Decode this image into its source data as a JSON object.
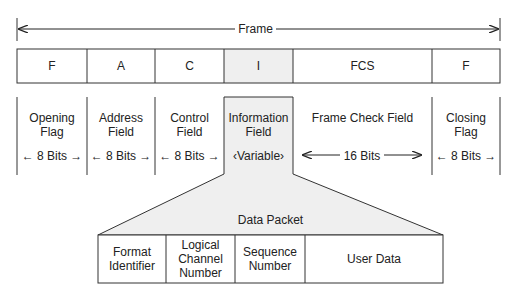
{
  "frame": {
    "title": "Frame",
    "fields": [
      {
        "abbr": "F",
        "name_line1": "Opening",
        "name_line2": "Flag",
        "size": "8 Bits"
      },
      {
        "abbr": "A",
        "name_line1": "Address",
        "name_line2": "Field",
        "size": "8 Bits"
      },
      {
        "abbr": "C",
        "name_line1": "Control",
        "name_line2": "Field",
        "size": "8 Bits"
      },
      {
        "abbr": "I",
        "name_line1": "Information",
        "name_line2": "Field",
        "size": "Variable"
      },
      {
        "abbr": "FCS",
        "name_line1": "Frame Check Field",
        "name_line2": "",
        "size": "16 Bits"
      },
      {
        "abbr": "F",
        "name_line1": "Closing",
        "name_line2": "Flag",
        "size": "8 Bits"
      }
    ]
  },
  "packet": {
    "title": "Data Packet",
    "fields": [
      {
        "line1": "Format",
        "line2": "Identifier",
        "line3": ""
      },
      {
        "line1": "Logical",
        "line2": "Channel",
        "line3": "Number"
      },
      {
        "line1": "Sequence",
        "line2": "Number",
        "line3": ""
      },
      {
        "line1": "User Data",
        "line2": "",
        "line3": ""
      }
    ]
  },
  "colors": {
    "line": "#333333",
    "highlight_fill": "#efefef"
  }
}
